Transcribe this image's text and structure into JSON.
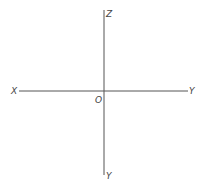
{
  "diagram": {
    "type": "coordinate-axes",
    "labels": {
      "z_top": "Z",
      "x_left": "X",
      "y_right": "Y",
      "origin": "O",
      "y_bottom": "Y"
    },
    "colors": {
      "axis": "#555555",
      "label": "#444444"
    }
  }
}
